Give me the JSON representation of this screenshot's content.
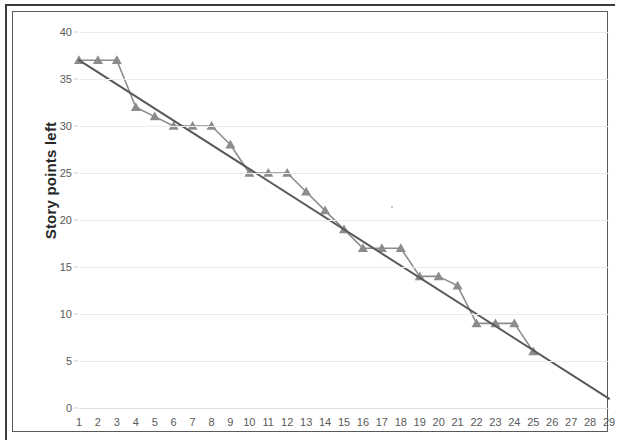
{
  "chart_data": {
    "type": "line",
    "title": "",
    "xlabel": "",
    "ylabel": "Story points left",
    "xlim": [
      1,
      29
    ],
    "ylim": [
      0,
      40
    ],
    "grid": true,
    "legend": "none",
    "x": [
      1,
      2,
      3,
      4,
      5,
      6,
      7,
      8,
      9,
      10,
      11,
      12,
      13,
      14,
      15,
      16,
      17,
      18,
      19,
      20,
      21,
      22,
      23,
      24,
      25,
      26,
      27,
      28,
      29
    ],
    "x_tick_labels": [
      "1",
      "2",
      "3",
      "4",
      "5",
      "6",
      "7",
      "8",
      "9",
      "10",
      "11",
      "12",
      "13",
      "14",
      "15",
      "16",
      "17",
      "18",
      "19",
      "20",
      "21",
      "22",
      "23",
      "24",
      "25",
      "26",
      "27",
      "28",
      "29"
    ],
    "y_tick_labels": [
      "0",
      "5",
      "10",
      "15",
      "20",
      "25",
      "30",
      "35",
      "40"
    ],
    "y_ticks": [
      0,
      5,
      10,
      15,
      20,
      25,
      30,
      35,
      40
    ],
    "series": [
      {
        "name": "actual-burndown",
        "marker": "triangle",
        "color": "#8c8c8c",
        "x": [
          1,
          2,
          3,
          4,
          5,
          6,
          7,
          8,
          9,
          10,
          11,
          12,
          13,
          14,
          15,
          16,
          17,
          18,
          19,
          20,
          21,
          22,
          23,
          24,
          25
        ],
        "values": [
          37,
          37,
          37,
          32,
          31,
          30,
          30,
          30,
          28,
          25,
          25,
          25,
          23,
          21,
          19,
          17,
          17,
          17,
          14,
          14,
          13,
          9,
          9,
          9,
          6
        ]
      },
      {
        "name": "ideal-trend-line",
        "marker": "none",
        "color": "#595959",
        "x": [
          1,
          29
        ],
        "values": [
          37,
          1
        ]
      }
    ]
  },
  "axes": {
    "y_title": "Story points left"
  },
  "colors": {
    "actual_series": "#8c8c8c",
    "trend_line": "#595959",
    "gridline": "#ececec",
    "tick_label": "#595959",
    "axis_title": "#262626",
    "frame": "#3a3a3a"
  }
}
